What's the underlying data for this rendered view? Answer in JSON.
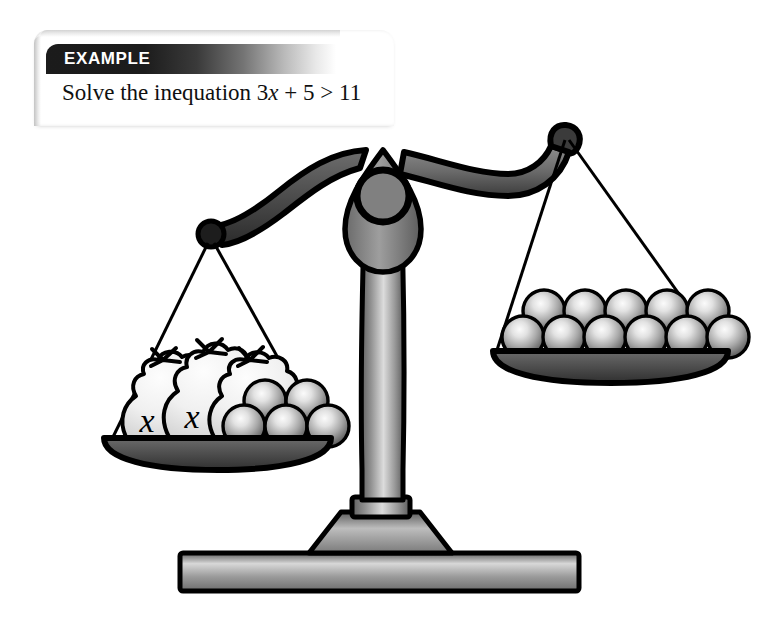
{
  "page": {
    "width": 762,
    "height": 635,
    "background_color": "#ffffff"
  },
  "example": {
    "badge_label": "EXAMPLE",
    "badge_color_dark": "#1b1b1b",
    "badge_text_color": "#ffffff",
    "prompt_prefix": "Solve the inequation ",
    "expression_full": "3x + 5 > 11",
    "expression_parts": {
      "coefficient": "3",
      "variable": "x",
      "plus": " + ",
      "constant": "5",
      "relation": " > ",
      "right_side": "11"
    }
  },
  "illustration": {
    "type": "balance-scale",
    "alt": "Balance scale tilted with three bags labelled x plus five balls on the left pan and eleven balls on the right pan",
    "line_color": "#000000",
    "metal_light": "#d9d9d9",
    "metal_mid": "#8d8d8d",
    "metal_dark": "#4a4a4a",
    "ball_highlight": "#f2f2f2",
    "ball_shadow": "#4d4d4d",
    "bag_fill": "#f1f1f1",
    "left_pan": {
      "bags_count": 3,
      "bag_labels": [
        "x",
        "x",
        "x"
      ],
      "balls_count": 5,
      "balls_bottom_row": 3,
      "balls_top_row": 2,
      "represents": "3x + 5"
    },
    "right_pan": {
      "balls_count": 11,
      "balls_bottom_row": 6,
      "balls_top_row": 5,
      "represents": "11"
    },
    "tilt": "left-side-down"
  }
}
